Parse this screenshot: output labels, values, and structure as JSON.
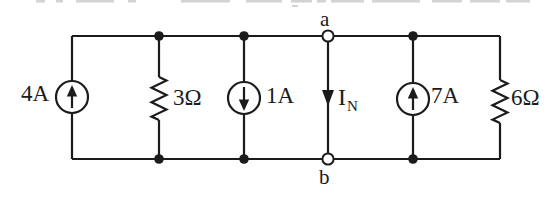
{
  "canvas": {
    "background": "#ffffff",
    "ink": "#1b1b1b",
    "fragment_color": "#b0b0b0"
  },
  "circuit": {
    "description": "Parallel circuit of current sources and resistors between terminals a and b (Norton current IN marked)",
    "terminals": [
      {
        "id": "terminal-a",
        "label": "a",
        "position": "top",
        "style": "open-node"
      },
      {
        "id": "terminal-b",
        "label": "b",
        "position": "bottom",
        "style": "open-node"
      }
    ],
    "components": [
      {
        "id": "current-source-4A",
        "type": "current-source",
        "value": "4A",
        "arrow": "up"
      },
      {
        "id": "resistor-3ohm",
        "type": "resistor",
        "value": "3Ω"
      },
      {
        "id": "current-source-1A",
        "type": "current-source",
        "value": "1A",
        "arrow": "down"
      },
      {
        "id": "norton-current",
        "type": "branch-current",
        "value": "IN",
        "label_main": "I",
        "label_sub": "N",
        "arrow": "down"
      },
      {
        "id": "current-source-7A",
        "type": "current-source",
        "value": "7A",
        "arrow": "up"
      },
      {
        "id": "resistor-6ohm",
        "type": "resistor",
        "value": "6Ω"
      }
    ]
  }
}
